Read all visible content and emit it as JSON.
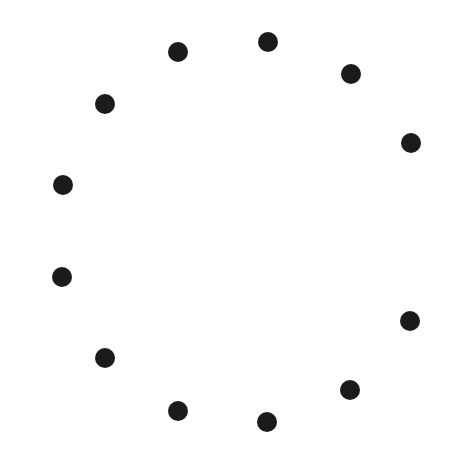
{
  "canvas": {
    "width": 455,
    "height": 456,
    "background": "#ffffff"
  },
  "dot_style": {
    "radius": 10,
    "color": "#1b1b1b"
  },
  "dots": [
    {
      "x": 268,
      "y": 42
    },
    {
      "x": 351,
      "y": 74
    },
    {
      "x": 411,
      "y": 143
    },
    {
      "x": 410,
      "y": 321
    },
    {
      "x": 350,
      "y": 390
    },
    {
      "x": 267,
      "y": 422
    },
    {
      "x": 178,
      "y": 411
    },
    {
      "x": 105,
      "y": 358
    },
    {
      "x": 62,
      "y": 277
    },
    {
      "x": 63,
      "y": 185
    },
    {
      "x": 105,
      "y": 104
    },
    {
      "x": 178,
      "y": 52
    }
  ]
}
